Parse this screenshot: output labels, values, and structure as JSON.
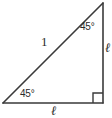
{
  "figure": {
    "kind": "geometry-diagram",
    "shape": "right-triangle",
    "background_color": "#ffffff",
    "stroke_color": "#3a3a3a",
    "text_color": "#2b2b2b",
    "width": 112,
    "height": 118,
    "vertices": {
      "bottom_left": {
        "x": 3,
        "y": 103
      },
      "bottom_right": {
        "x": 103,
        "y": 103
      },
      "top_right": {
        "x": 103,
        "y": 3
      }
    },
    "angles": {
      "bottom_left": "45°",
      "top_right": "45°",
      "bottom_right": "90°"
    },
    "right_angle_marker": {
      "present": true,
      "at": "bottom_right",
      "size": 10
    },
    "sides": {
      "hypotenuse": "1",
      "vertical_leg": "ℓ",
      "horizontal_leg": "ℓ"
    }
  }
}
